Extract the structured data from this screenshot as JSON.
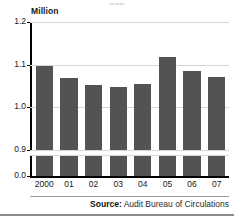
{
  "figure": {
    "clipped_title": "ooo",
    "unit_label": "Million",
    "bar_color": "#535353",
    "gridline_color": "#d6d6d6",
    "axis_color": "#000000"
  },
  "source": {
    "label": "Source:",
    "text": " Audit Bureau of Circulations"
  },
  "chart_data": {
    "type": "bar",
    "title": "",
    "subtitle": "",
    "xlabel": "",
    "ylabel": "Million",
    "categories": [
      "2000",
      "01",
      "02",
      "03",
      "04",
      "05",
      "06",
      "07"
    ],
    "values": [
      1.097,
      1.068,
      1.052,
      1.048,
      1.055,
      1.118,
      1.086,
      1.07
    ],
    "series": [
      {
        "name": "Circulation",
        "values": [
          1.097,
          1.068,
          1.052,
          1.048,
          1.055,
          1.118,
          1.086,
          1.07
        ]
      }
    ],
    "ylim": [
      0.85,
      1.2
    ],
    "ytick_labels": [
      "1.2",
      "1.1",
      "1.0",
      "0.9",
      "0.0"
    ],
    "ytick_values": [
      1.2,
      1.1,
      1.0,
      0.9,
      0.0
    ],
    "axis_break": true,
    "axis_break_between": [
      0.9,
      0.0
    ],
    "grid": true,
    "legend": "none",
    "annotations": [
      "Source: Audit Bureau of Circulations"
    ]
  }
}
